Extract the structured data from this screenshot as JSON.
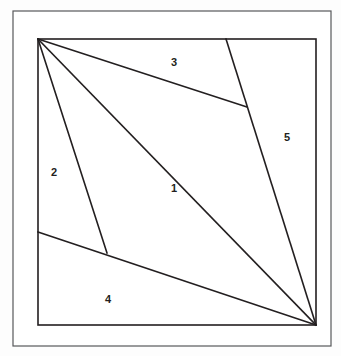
{
  "figure": {
    "canvas": {
      "width": 341,
      "height": 356
    },
    "colors": {
      "background": "#fdfdfd",
      "paper": "#ffffff",
      "stroke": "#231f20",
      "outer_frame_stroke": "#58595b",
      "label_text": "#231f20"
    },
    "outer_frame": {
      "x": 13,
      "y": 11,
      "width": 318,
      "height": 335,
      "stroke_width": 1.2
    },
    "inner_square": {
      "x": 38,
      "y": 39,
      "width": 278,
      "height": 286,
      "stroke_width": 1.6
    },
    "vertices": {
      "top_left": {
        "x": 38,
        "y": 39
      },
      "top_right": {
        "x": 316,
        "y": 39
      },
      "bottom_right": {
        "x": 316,
        "y": 325
      },
      "bottom_left": {
        "x": 38,
        "y": 325
      },
      "line5_top": {
        "x": 226,
        "y": 39
      },
      "line3_end": {
        "x": 247,
        "y": 107
      },
      "junction_2_4": {
        "x": 107,
        "y": 253
      },
      "line4_left_edge": {
        "x": 38,
        "y": 232
      }
    },
    "segments": [
      {
        "name": "segment-top-left-to-mid-right",
        "x1": 38,
        "y1": 39,
        "x2": 247,
        "y2": 107
      },
      {
        "name": "segment-top-left-to-junction",
        "x1": 38,
        "y1": 39,
        "x2": 107,
        "y2": 253
      },
      {
        "name": "segment-top-left-to-bottom-right",
        "x1": 38,
        "y1": 39,
        "x2": 316,
        "y2": 325
      },
      {
        "name": "segment-line5-top-to-bottom-right",
        "x1": 226,
        "y1": 39,
        "x2": 316,
        "y2": 325
      },
      {
        "name": "segment-left-edge-to-bottom-right",
        "x1": 38,
        "y1": 232,
        "x2": 316,
        "y2": 325
      }
    ],
    "labels": [
      {
        "name": "region-label-1",
        "text": "1",
        "x": 174,
        "y": 192
      },
      {
        "name": "region-label-2",
        "text": "2",
        "x": 54,
        "y": 176
      },
      {
        "name": "region-label-3",
        "text": "3",
        "x": 174,
        "y": 66
      },
      {
        "name": "region-label-4",
        "text": "4",
        "x": 108,
        "y": 303
      },
      {
        "name": "region-label-5",
        "text": "5",
        "x": 287,
        "y": 141
      }
    ]
  }
}
